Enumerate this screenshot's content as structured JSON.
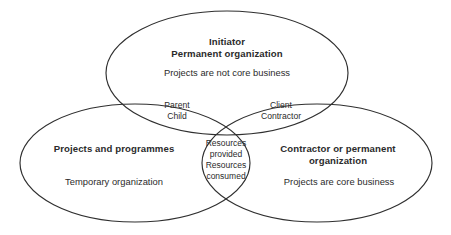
{
  "diagram": {
    "type": "venn",
    "set_count": 3,
    "background_color": "#ffffff",
    "stroke_color": "#2f2f2f",
    "text_color": "#2b2b2b",
    "sets": {
      "top": {
        "title": "Initiator\nPermanent organization",
        "subtitle": "Projects are not core business"
      },
      "bottom_left": {
        "title": "Projects and programmes",
        "subtitle": "Temporary organization"
      },
      "bottom_right": {
        "title": "Contractor or permanent\norganization",
        "subtitle": "Projects are core business"
      }
    },
    "intersections": {
      "top_left": "Parent\nChild",
      "top_right": "Client\nContractor",
      "center": "Resources\nprovided\nResources\nconsumed"
    }
  }
}
